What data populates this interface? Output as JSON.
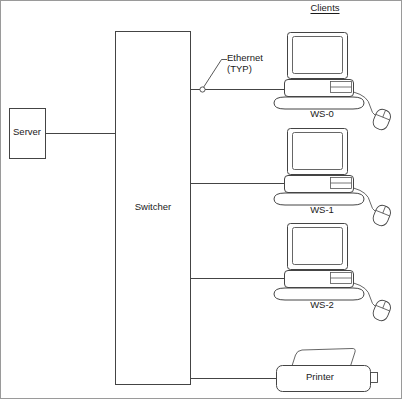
{
  "diagram": {
    "header": {
      "clients_label": "Clients"
    },
    "nodes": {
      "server": {
        "label": "Server",
        "shape": "rectangle"
      },
      "switcher": {
        "label": "Switcher",
        "shape": "rectangle"
      },
      "workstations": [
        {
          "label": "WS-0",
          "icon": "desktop-computer-icon"
        },
        {
          "label": "WS-1",
          "icon": "desktop-computer-icon"
        },
        {
          "label": "WS-2",
          "icon": "desktop-computer-icon"
        }
      ],
      "printer": {
        "label": "Printer",
        "icon": "printer-icon"
      }
    },
    "annotations": {
      "ethernet_callout_line1": "Ethernet",
      "ethernet_callout_line2": "(TYP)"
    },
    "style": {
      "line_color": "#444444",
      "border_color": "#808080",
      "text_color": "#1a1a1a",
      "background": "#ffffff"
    }
  }
}
